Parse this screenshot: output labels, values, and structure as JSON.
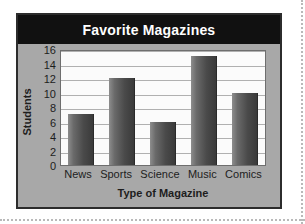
{
  "chart_data": {
    "type": "bar",
    "title": "Favorite Magazines",
    "xlabel": "Type of Magazine",
    "ylabel": "Students",
    "categories": [
      "News",
      "Sports",
      "Science",
      "Music",
      "Comics"
    ],
    "values": [
      7,
      12,
      6,
      15,
      10
    ],
    "ylim": [
      0,
      16
    ],
    "ytick_step": 2,
    "yticks": [
      0,
      2,
      4,
      6,
      8,
      10,
      12,
      14,
      16
    ],
    "ytick_labels": [
      "0",
      "2",
      "4",
      "6",
      "8",
      "10",
      "12",
      "14",
      "16"
    ],
    "grid": true,
    "grid_axis": "y",
    "legend": false,
    "legend_position": "none",
    "bar_color": "#4a4a4a",
    "bar_color_light": "#8d8d8d",
    "title_band_color": "#111111",
    "title_text_color": "#ffffff",
    "panel_color": "#a8a8a8",
    "plot_background": "#fbfbfb",
    "frame_color": "#2c2c2c"
  }
}
